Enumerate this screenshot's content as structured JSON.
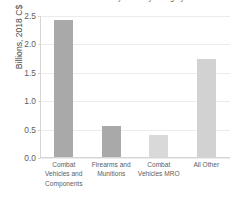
{
  "chart_data": {
    "type": "bar",
    "title": "Canadian Military Sales by Category",
    "ylabel": "Billions, 2018 C$",
    "xlabel": "",
    "categories": [
      "Combat Vehicles and Components",
      "Firearms and Munitions",
      "Combat Vehicles MRO",
      "All Other"
    ],
    "values": [
      2.42,
      0.54,
      0.38,
      1.72
    ],
    "ylim": [
      0.0,
      2.5
    ],
    "ytick_labels": [
      "0.0",
      "0.5",
      "1.0",
      "1.5",
      "2.0",
      "2.5"
    ],
    "ytick_values": [
      0.0,
      0.5,
      1.0,
      1.5,
      2.0,
      2.5
    ],
    "grid": true,
    "legend": false,
    "bar_colors": [
      "#a9a9a9",
      "#a9a9a9",
      "#d9d9d9",
      "#d2d2d2"
    ],
    "grid_color": "#eceaea",
    "axis_color": "#d6d4d4",
    "text_color": "#5e5e5e"
  }
}
